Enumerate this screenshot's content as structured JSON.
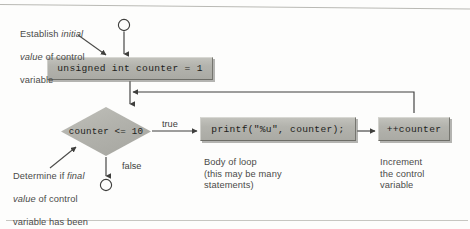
{
  "diagram": {
    "type": "flowchart",
    "nodes": {
      "start_connector": {
        "shape": "circle",
        "label": ""
      },
      "init_statement": {
        "shape": "process",
        "code": "unsigned int counter = 1"
      },
      "condition": {
        "shape": "decision",
        "code": "counter <= 10"
      },
      "loop_body": {
        "shape": "process",
        "code": "printf(\"%u\", counter);"
      },
      "increment": {
        "shape": "process",
        "code": "++counter"
      },
      "end_connector": {
        "shape": "circle",
        "label": ""
      }
    },
    "branches": {
      "true_label": "true",
      "false_label": "false"
    },
    "annotations": {
      "establish": {
        "line1_pre": "Establish ",
        "line1_italic": "initial",
        "line2_italic": "value",
        "line2_post": " of control",
        "line3": "variable"
      },
      "determine": {
        "line1_pre": "Determine if ",
        "line1_italic": "final",
        "line2_italic": "value",
        "line2_post": " of control",
        "line3": "variable has been",
        "line4": "reached"
      },
      "body_caption": "Body of loop\n(this may be many\nstatements)",
      "increment_caption": "Increment\nthe control\nvariable"
    },
    "colors": {
      "box_fill": "#b3b3ad",
      "box_highlight": "#d8d8d3",
      "box_shadow": "#6d6d67",
      "line": "#4a4a48",
      "text": "#1d1d1b",
      "note_text": "#4b4b49",
      "background": "#fdfdfc"
    }
  }
}
